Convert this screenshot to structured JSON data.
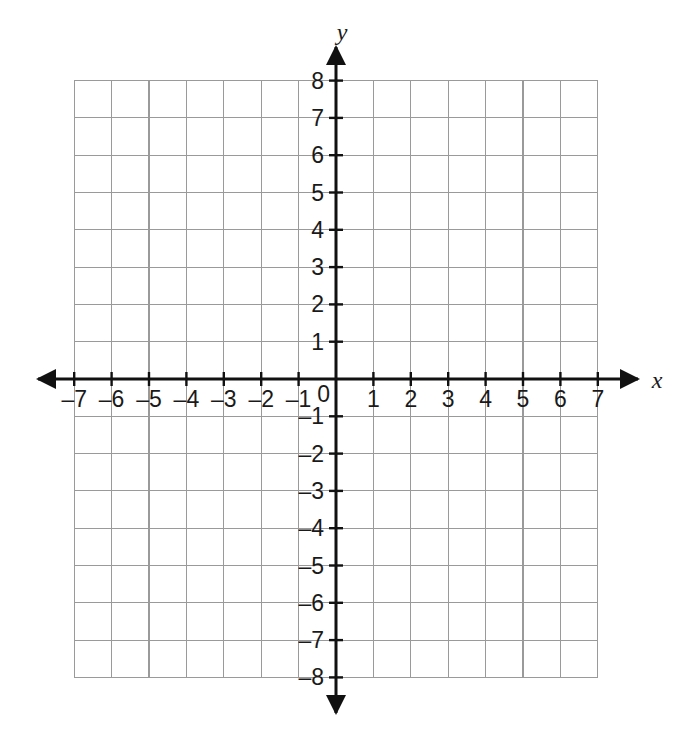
{
  "chart_data": {
    "type": "scatter",
    "title": "",
    "subtitle": "",
    "xlabel": "x",
    "ylabel": "y",
    "xlim": [
      -7,
      7
    ],
    "ylim": [
      -8,
      8
    ],
    "x_ticks": [
      -7,
      -6,
      -5,
      -4,
      -3,
      -2,
      -1,
      0,
      1,
      2,
      3,
      4,
      5,
      6,
      7
    ],
    "y_ticks": [
      -8,
      -7,
      -6,
      -5,
      -4,
      -3,
      -2,
      -1,
      0,
      1,
      2,
      3,
      4,
      5,
      6,
      7,
      8
    ],
    "x_tick_labels": [
      "–7",
      "–6",
      "–5",
      "–4",
      "–3",
      "–2",
      "–1",
      "1",
      "2",
      "3",
      "4",
      "5",
      "6",
      "7"
    ],
    "y_tick_labels": [
      "8",
      "7",
      "6",
      "5",
      "4",
      "3",
      "2",
      "1",
      "–1",
      "–2",
      "–3",
      "–4",
      "–5",
      "–6",
      "–7",
      "–8"
    ],
    "origin_label": "0",
    "grid": true,
    "grid_step": 1,
    "legend": null,
    "series": [],
    "values": [],
    "categories": [],
    "annotations": [],
    "colors": {
      "background": "#ffffff",
      "gridline": "#9a9a9a",
      "axis": "#111111",
      "label": "#1a1a1a"
    }
  },
  "axes": {
    "x_axis_label": "x",
    "y_axis_label": "y"
  }
}
